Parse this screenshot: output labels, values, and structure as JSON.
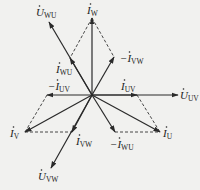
{
  "diagram": {
    "type": "phasor-diagram",
    "origin": [
      92,
      95
    ],
    "colors": {
      "line": "#2a2a2a",
      "background": "#f1f1ef"
    },
    "phasors": [
      {
        "id": "U_UV",
        "main": "U",
        "sub": "UV",
        "tip": [
          178,
          95
        ],
        "label": [
          180,
          99
        ],
        "kind": "voltage"
      },
      {
        "id": "U_WU",
        "main": "U",
        "sub": "WU",
        "tip": [
          49,
          22
        ],
        "label": [
          36,
          16
        ],
        "kind": "voltage"
      },
      {
        "id": "U_VW",
        "main": "U",
        "sub": "VW",
        "tip": [
          51,
          168
        ],
        "label": [
          38,
          180
        ],
        "kind": "voltage"
      },
      {
        "id": "I_W",
        "main": "I",
        "sub": "W",
        "tip": [
          92,
          18
        ],
        "label": [
          87,
          14
        ],
        "kind": "current"
      },
      {
        "id": "I_U",
        "main": "I",
        "sub": "U",
        "tip": [
          160,
          132
        ],
        "label": [
          163,
          137
        ],
        "kind": "current"
      },
      {
        "id": "I_V",
        "main": "I",
        "sub": "V",
        "tip": [
          25,
          132
        ],
        "label": [
          10,
          137
        ],
        "kind": "current"
      },
      {
        "id": "I_UV",
        "main": "I",
        "sub": "UV",
        "tip": [
          137,
          95
        ],
        "label": [
          121,
          90
        ],
        "kind": "current"
      },
      {
        "id": "neg_I_UV",
        "main": "−I",
        "sub": "UV",
        "tip": [
          47,
          95
        ],
        "label": [
          48,
          90
        ],
        "kind": "current"
      },
      {
        "id": "I_WU",
        "main": "I",
        "sub": "WU",
        "tip": [
          70,
          58
        ],
        "label": [
          56,
          73
        ],
        "kind": "current"
      },
      {
        "id": "neg_I_VW",
        "main": "−I",
        "sub": "VW",
        "tip": [
          114,
          57
        ],
        "label": [
          120,
          62
        ],
        "kind": "current"
      },
      {
        "id": "I_VW",
        "main": "I",
        "sub": "VW",
        "tip": [
          72,
          132
        ],
        "label": [
          76,
          145
        ],
        "kind": "current"
      },
      {
        "id": "neg_I_WU",
        "main": "−I",
        "sub": "WU",
        "tip": [
          115,
          132
        ],
        "label": [
          110,
          148
        ],
        "kind": "current"
      }
    ],
    "dashed": [
      [
        [
          92,
          18
        ],
        [
          70,
          58
        ]
      ],
      [
        [
          92,
          18
        ],
        [
          114,
          57
        ]
      ],
      [
        [
          47,
          95
        ],
        [
          25,
          132
        ]
      ],
      [
        [
          25,
          132
        ],
        [
          72,
          132
        ]
      ],
      [
        [
          137,
          95
        ],
        [
          160,
          132
        ]
      ],
      [
        [
          115,
          132
        ],
        [
          160,
          132
        ]
      ]
    ]
  }
}
